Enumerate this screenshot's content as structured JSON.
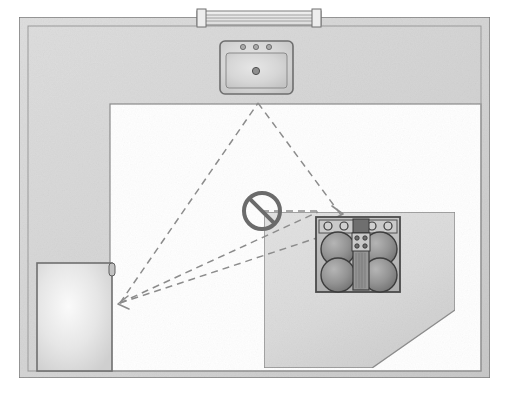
{
  "diagram": {
    "type": "floor-plan",
    "canvas": {
      "width": 508,
      "height": 394,
      "background": "#ffffff"
    }
  },
  "colors": {
    "background": "#ffffff",
    "wall_fill": "#d6d6d6",
    "wall_stroke": "#7a7a7a",
    "counter_fill": "#dcdcdc",
    "counter_stroke": "#8a8a8a",
    "island_fill": "#dedede",
    "island_stroke": "#8e8e8e",
    "floor_fill": "#ffffff",
    "sink_fill": "#d2d2d2",
    "sink_stroke": "#6e6e6e",
    "fridge_fill": "#e4e4e4",
    "fridge_stroke": "#6f6f6f",
    "stove_fill": "#b8b8b8",
    "stove_stroke": "#4a4a4a",
    "burner_fill": "#8f8f8f",
    "burner_stroke": "#3d3d3d",
    "knob_fill": "#cfcfcf",
    "knob_stroke": "#3a3a3a",
    "triangle_line": "#8c8c8c",
    "prohibition_sign": "#6b6b6b",
    "window_fill": "#e8e8e8",
    "window_stroke": "#7d7d7d"
  },
  "room": {
    "name": "L-shaped kitchen",
    "outer_wall": {
      "x": 19,
      "y": 17,
      "width": 471,
      "height": 361
    },
    "inner_floor": {
      "x": 110,
      "y": 104,
      "width": 371,
      "height": 267
    },
    "wall_thickness": 18
  },
  "window": {
    "label": "window",
    "x": 197,
    "y": 10,
    "width": 124,
    "height": 15,
    "mullion_count": 2,
    "glazing_lines": 3
  },
  "fixtures": {
    "sink": {
      "label": "sink",
      "x": 220,
      "y": 41,
      "width": 73,
      "height": 53,
      "faucet_holes": 3,
      "drain": true,
      "vertex": {
        "x": 258,
        "y": 103
      }
    },
    "refrigerator": {
      "label": "refrigerator",
      "x": 37,
      "y": 263,
      "width": 75,
      "height": 108,
      "handle_side": "right",
      "vertex": {
        "x": 120,
        "y": 303
      }
    },
    "cooktop": {
      "label": "cooktop",
      "x": 316,
      "y": 217,
      "width": 84,
      "height": 75,
      "burners": 4,
      "knobs": 4,
      "center_module_controls": 4,
      "griddle": true,
      "vertex": {
        "x": 340,
        "y": 216
      }
    }
  },
  "island": {
    "label": "island counter",
    "points": "264,212 455,212 455,310 372,368 264,368",
    "chamfer_corner": "bottom-right"
  },
  "work_triangle": {
    "label": "work triangle",
    "style": "dashed",
    "legs": [
      {
        "from": "refrigerator",
        "to": "sink",
        "x1": 120,
        "y1": 303,
        "x2": 258,
        "y2": 103
      },
      {
        "from": "sink",
        "to": "cooktop",
        "x1": 258,
        "y1": 103,
        "x2": 340,
        "y2": 216
      },
      {
        "from": "cooktop",
        "to": "refrigerator",
        "x1": 340,
        "y1": 230,
        "x2": 120,
        "y2": 303
      },
      {
        "from": "blocked-path",
        "to": "refrigerator",
        "x1": 316,
        "y1": 211,
        "x2": 120,
        "y2": 303
      }
    ],
    "blocked_segment": {
      "x1": 262,
      "y1": 211,
      "x2": 316,
      "y2": 211
    }
  },
  "prohibition_sign": {
    "label": "no-entry sign",
    "meaning": "work triangle path obstructed",
    "center": {
      "x": 262,
      "y": 211
    },
    "radius": 18,
    "stroke_width": 4,
    "slash_angle_deg": 45
  }
}
